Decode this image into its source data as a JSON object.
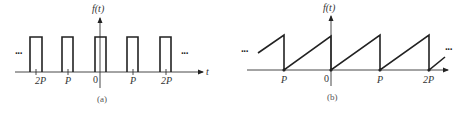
{
  "figure_a": {
    "caption": "(a)",
    "y_axis_label": "f(t)",
    "x_axis_label": "t",
    "tick_labels": [
      "2P",
      "P",
      "0",
      "P",
      "2P"
    ],
    "ellipsis_left": "···",
    "ellipsis_right": "···",
    "waveform": "periodic rectangular pulse train",
    "pulse_count_visible": 5
  },
  "figure_b": {
    "caption": "(b)",
    "y_axis_label": "f(t)",
    "tick_labels": [
      "P",
      "0",
      "P",
      "2P"
    ],
    "ellipsis_left": "···",
    "ellipsis_right": "···",
    "waveform": "periodic sawtooth wave"
  },
  "colors": {
    "stroke": "#222222",
    "text": "#333333",
    "background": "#ffffff"
  }
}
